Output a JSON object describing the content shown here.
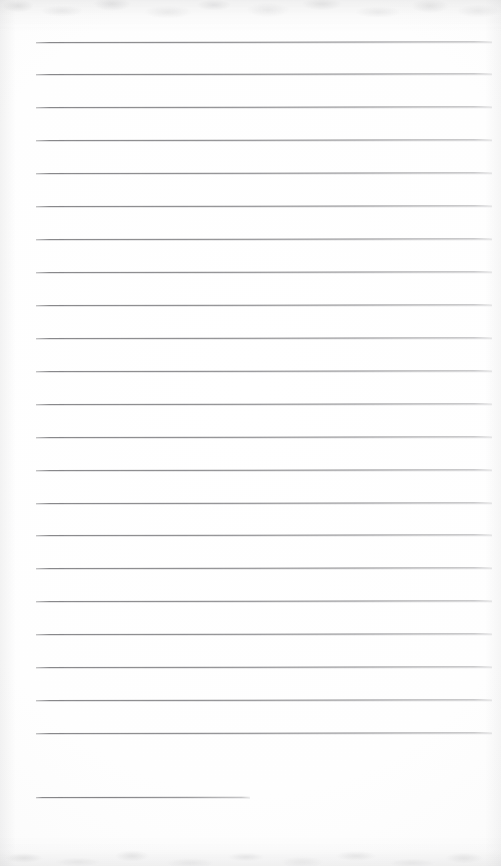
{
  "document": {
    "kind": "scanned-lined-paper",
    "title": "Blank ruled notepad page (scan)",
    "page_width_px": 501,
    "page_height_px": 866,
    "background_color": "#ffffff",
    "paper_tone": "#fbfbfb",
    "rule_color": "#7a7a7d",
    "rule_thickness_px": 1,
    "written_text": "",
    "handwriting_present": false,
    "scan_artifacts": {
      "top_edge_noise": true,
      "bottom_edge_noise": true,
      "edge_shadow_color": "#b4b4b6",
      "page_skew_degrees": -0.09
    }
  },
  "ruled_lines": {
    "count": 23,
    "full_width_count": 22,
    "short_line_count": 1,
    "left_margin_px": 36,
    "right_edge_px": 492,
    "first_line_y_px": 41.5,
    "line_spacing_px": 32.93,
    "lines": [
      {
        "index": 1,
        "y": 41.5,
        "x1": 36,
        "x2": 492,
        "width": 456,
        "type": "full"
      },
      {
        "index": 2,
        "y": 74.4,
        "x1": 36,
        "x2": 492,
        "width": 456,
        "type": "full"
      },
      {
        "index": 3,
        "y": 107.4,
        "x1": 36,
        "x2": 492,
        "width": 456,
        "type": "full"
      },
      {
        "index": 4,
        "y": 140.3,
        "x1": 36,
        "x2": 492,
        "width": 456,
        "type": "full"
      },
      {
        "index": 5,
        "y": 173.2,
        "x1": 36,
        "x2": 492,
        "width": 456,
        "type": "full"
      },
      {
        "index": 6,
        "y": 206.1,
        "x1": 36,
        "x2": 492,
        "width": 456,
        "type": "full"
      },
      {
        "index": 7,
        "y": 239.1,
        "x1": 36,
        "x2": 492,
        "width": 456,
        "type": "full"
      },
      {
        "index": 8,
        "y": 272.0,
        "x1": 36,
        "x2": 492,
        "width": 456,
        "type": "full"
      },
      {
        "index": 9,
        "y": 304.9,
        "x1": 36,
        "x2": 492,
        "width": 456,
        "type": "full"
      },
      {
        "index": 10,
        "y": 337.8,
        "x1": 36,
        "x2": 492,
        "width": 456,
        "type": "full"
      },
      {
        "index": 11,
        "y": 370.8,
        "x1": 36,
        "x2": 492,
        "width": 456,
        "type": "full"
      },
      {
        "index": 12,
        "y": 403.7,
        "x1": 36,
        "x2": 492,
        "width": 456,
        "type": "full"
      },
      {
        "index": 13,
        "y": 436.6,
        "x1": 36,
        "x2": 492,
        "width": 456,
        "type": "full"
      },
      {
        "index": 14,
        "y": 469.5,
        "x1": 36,
        "x2": 492,
        "width": 456,
        "type": "full"
      },
      {
        "index": 15,
        "y": 502.5,
        "x1": 36,
        "x2": 492,
        "width": 456,
        "type": "full"
      },
      {
        "index": 16,
        "y": 535.4,
        "x1": 36,
        "x2": 492,
        "width": 456,
        "type": "full"
      },
      {
        "index": 17,
        "y": 568.3,
        "x1": 36,
        "x2": 492,
        "width": 456,
        "type": "full"
      },
      {
        "index": 18,
        "y": 601.2,
        "x1": 36,
        "x2": 492,
        "width": 456,
        "type": "full"
      },
      {
        "index": 19,
        "y": 634.2,
        "x1": 36,
        "x2": 492,
        "width": 456,
        "type": "full"
      },
      {
        "index": 20,
        "y": 667.1,
        "x1": 36,
        "x2": 492,
        "width": 456,
        "type": "full"
      },
      {
        "index": 21,
        "y": 700.0,
        "x1": 36,
        "x2": 492,
        "width": 456,
        "type": "full"
      },
      {
        "index": 22,
        "y": 732.9,
        "x1": 36,
        "x2": 492,
        "width": 456,
        "type": "full"
      },
      {
        "index": 23,
        "y": 797.0,
        "x1": 36,
        "x2": 250,
        "width": 214,
        "type": "short"
      }
    ]
  }
}
